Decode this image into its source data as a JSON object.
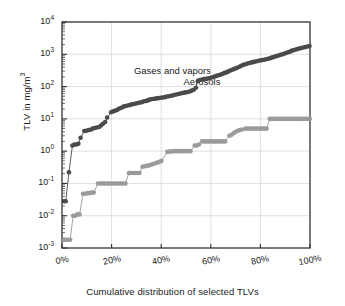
{
  "chart_data": {
    "type": "line",
    "title": "",
    "xlabel": "Cumulative distribution of selected TLVs",
    "ylabel": "TLV in mg/m3",
    "ylabel_display": "TLV in mg/m",
    "ylabel_exponent": "3",
    "xlim": [
      0,
      100
    ],
    "ylim": [
      0.001,
      10000
    ],
    "yscale": "log",
    "grid": true,
    "legend_position": "inline-annotation",
    "xticks": [
      0,
      20,
      40,
      60,
      80,
      100
    ],
    "xticklabels": [
      "0%",
      "20%",
      "40%",
      "60%",
      "80%",
      "100%"
    ],
    "yticks": [
      0.001,
      0.01,
      0.1,
      1,
      10,
      100,
      1000,
      10000
    ],
    "yticklabels": [
      "10-3",
      "10-2",
      "10-1",
      "100",
      "101",
      "102",
      "103",
      "104"
    ],
    "ytick_mantissa": "10",
    "ytick_exponents": [
      "-3",
      "-2",
      "-1",
      "0",
      "1",
      "2",
      "3",
      "4"
    ],
    "series": [
      {
        "name": "Gases and vapors",
        "color": "#4a4a4a",
        "label_x": 29,
        "label_y": 300,
        "points": [
          [
            0.8,
            0.028
          ],
          [
            1.5,
            0.028
          ],
          [
            2.8,
            0.22
          ],
          [
            4.2,
            1.5
          ],
          [
            5.0,
            1.6
          ],
          [
            5.8,
            1.6
          ],
          [
            6.6,
            1.7
          ],
          [
            7.5,
            2.6
          ],
          [
            9.0,
            4.2
          ],
          [
            9.9,
            4.3
          ],
          [
            10.7,
            4.5
          ],
          [
            11.5,
            4.6
          ],
          [
            12.4,
            5.0
          ],
          [
            13.2,
            5.2
          ],
          [
            14.0,
            5.4
          ],
          [
            14.9,
            5.6
          ],
          [
            15.7,
            6.2
          ],
          [
            16.5,
            7.0
          ],
          [
            17.4,
            8.0
          ],
          [
            18.2,
            11
          ],
          [
            19.8,
            16
          ],
          [
            20.6,
            17
          ],
          [
            21.5,
            18
          ],
          [
            22.3,
            19
          ],
          [
            23.1,
            21
          ],
          [
            24.0,
            22
          ],
          [
            24.8,
            24
          ],
          [
            25.6,
            25
          ],
          [
            26.5,
            26
          ],
          [
            27.3,
            27
          ],
          [
            28.1,
            28
          ],
          [
            29.0,
            29
          ],
          [
            29.8,
            30
          ],
          [
            30.6,
            31
          ],
          [
            31.5,
            32
          ],
          [
            32.3,
            33
          ],
          [
            33.1,
            35
          ],
          [
            34.0,
            36
          ],
          [
            34.8,
            38
          ],
          [
            35.6,
            40
          ],
          [
            36.5,
            41
          ],
          [
            37.3,
            42
          ],
          [
            38.1,
            43
          ],
          [
            39.0,
            44
          ],
          [
            39.8,
            45
          ],
          [
            40.6,
            46
          ],
          [
            41.5,
            47
          ],
          [
            42.3,
            49
          ],
          [
            43.1,
            50
          ],
          [
            44.0,
            52
          ],
          [
            44.8,
            54
          ],
          [
            45.6,
            56
          ],
          [
            46.5,
            58
          ],
          [
            47.3,
            60
          ],
          [
            48.1,
            62
          ],
          [
            49.0,
            64
          ],
          [
            49.8,
            66
          ],
          [
            50.6,
            68
          ],
          [
            51.5,
            70
          ],
          [
            52.3,
            75
          ],
          [
            53.1,
            80
          ],
          [
            54.0,
            92
          ],
          [
            54.8,
            150
          ],
          [
            55.6,
            160
          ],
          [
            56.5,
            165
          ],
          [
            57.3,
            170
          ],
          [
            58.1,
            175
          ],
          [
            59.0,
            180
          ],
          [
            59.8,
            185
          ],
          [
            60.6,
            195
          ],
          [
            61.5,
            205
          ],
          [
            62.3,
            215
          ],
          [
            63.1,
            225
          ],
          [
            64.0,
            235
          ],
          [
            64.8,
            250
          ],
          [
            65.6,
            265
          ],
          [
            66.5,
            280
          ],
          [
            67.3,
            300
          ],
          [
            68.1,
            320
          ],
          [
            69.0,
            340
          ],
          [
            69.8,
            360
          ],
          [
            70.6,
            380
          ],
          [
            71.5,
            410
          ],
          [
            72.3,
            440
          ],
          [
            73.1,
            470
          ],
          [
            74.0,
            490
          ],
          [
            74.8,
            520
          ],
          [
            75.6,
            540
          ],
          [
            76.5,
            560
          ],
          [
            77.3,
            580
          ],
          [
            78.1,
            600
          ],
          [
            79.0,
            620
          ],
          [
            79.8,
            640
          ],
          [
            80.6,
            660
          ],
          [
            81.5,
            680
          ],
          [
            82.3,
            700
          ],
          [
            83.1,
            730
          ],
          [
            84.0,
            760
          ],
          [
            84.8,
            800
          ],
          [
            85.6,
            840
          ],
          [
            86.5,
            880
          ],
          [
            87.3,
            920
          ],
          [
            88.1,
            960
          ],
          [
            89.0,
            1000
          ],
          [
            89.8,
            1060
          ],
          [
            90.6,
            1120
          ],
          [
            91.5,
            1180
          ],
          [
            92.3,
            1250
          ],
          [
            93.1,
            1320
          ],
          [
            94.0,
            1380
          ],
          [
            94.8,
            1450
          ],
          [
            95.6,
            1500
          ],
          [
            96.5,
            1560
          ],
          [
            97.3,
            1620
          ],
          [
            98.1,
            1680
          ],
          [
            99.0,
            1740
          ],
          [
            99.8,
            1800
          ]
        ]
      },
      {
        "name": "Aerosols",
        "color": "#9a9a9a",
        "label_x": 49,
        "label_y": 140,
        "points": [
          [
            0.8,
            0.0018
          ],
          [
            1.6,
            0.0018
          ],
          [
            2.5,
            0.0018
          ],
          [
            3.3,
            0.0018
          ],
          [
            4.5,
            0.01
          ],
          [
            5.4,
            0.01
          ],
          [
            6.2,
            0.011
          ],
          [
            7.1,
            0.011
          ],
          [
            8.5,
            0.048
          ],
          [
            9.4,
            0.048
          ],
          [
            10.2,
            0.05
          ],
          [
            11.1,
            0.05
          ],
          [
            11.9,
            0.052
          ],
          [
            12.8,
            0.052
          ],
          [
            14.5,
            0.1
          ],
          [
            15.4,
            0.1
          ],
          [
            16.2,
            0.1
          ],
          [
            17.1,
            0.1
          ],
          [
            17.9,
            0.1
          ],
          [
            18.8,
            0.1
          ],
          [
            19.6,
            0.1
          ],
          [
            20.5,
            0.1
          ],
          [
            21.3,
            0.1
          ],
          [
            22.2,
            0.1
          ],
          [
            23.0,
            0.1
          ],
          [
            23.9,
            0.1
          ],
          [
            24.7,
            0.1
          ],
          [
            25.6,
            0.1
          ],
          [
            27.0,
            0.21
          ],
          [
            27.8,
            0.21
          ],
          [
            28.7,
            0.21
          ],
          [
            29.5,
            0.21
          ],
          [
            30.4,
            0.21
          ],
          [
            31.2,
            0.21
          ],
          [
            32.5,
            0.33
          ],
          [
            33.3,
            0.34
          ],
          [
            34.2,
            0.35
          ],
          [
            35.0,
            0.36
          ],
          [
            35.9,
            0.38
          ],
          [
            36.7,
            0.4
          ],
          [
            37.6,
            0.42
          ],
          [
            38.4,
            0.44
          ],
          [
            39.3,
            0.47
          ],
          [
            40.1,
            0.5
          ],
          [
            42.5,
            0.95
          ],
          [
            43.3,
            0.97
          ],
          [
            44.2,
            0.98
          ],
          [
            45.0,
            0.99
          ],
          [
            45.9,
            1.0
          ],
          [
            46.7,
            1.0
          ],
          [
            47.6,
            1.0
          ],
          [
            48.4,
            1.0
          ],
          [
            49.3,
            1.0
          ],
          [
            50.1,
            1.0
          ],
          [
            51.0,
            1.0
          ],
          [
            51.8,
            1.0
          ],
          [
            53.5,
            1.5
          ],
          [
            54.3,
            1.5
          ],
          [
            55.2,
            1.6
          ],
          [
            56.5,
            2.0
          ],
          [
            57.3,
            2.0
          ],
          [
            58.2,
            2.0
          ],
          [
            59.0,
            2.0
          ],
          [
            59.9,
            2.0
          ],
          [
            60.7,
            2.0
          ],
          [
            61.6,
            2.0
          ],
          [
            62.4,
            2.0
          ],
          [
            63.3,
            2.0
          ],
          [
            64.1,
            2.0
          ],
          [
            65.0,
            2.0
          ],
          [
            65.8,
            2.0
          ],
          [
            67.5,
            3.0
          ],
          [
            68.3,
            3.2
          ],
          [
            69.2,
            3.6
          ],
          [
            70.0,
            4.0
          ],
          [
            70.9,
            4.3
          ],
          [
            71.7,
            4.5
          ],
          [
            72.6,
            4.7
          ],
          [
            74.0,
            5.0
          ],
          [
            74.8,
            5.0
          ],
          [
            75.7,
            5.0
          ],
          [
            76.5,
            5.0
          ],
          [
            77.4,
            5.0
          ],
          [
            78.2,
            5.0
          ],
          [
            79.1,
            5.0
          ],
          [
            79.9,
            5.0
          ],
          [
            80.8,
            5.0
          ],
          [
            81.6,
            5.0
          ],
          [
            82.5,
            5.0
          ],
          [
            83.8,
            10
          ],
          [
            84.6,
            10
          ],
          [
            85.5,
            10
          ],
          [
            86.3,
            10
          ],
          [
            87.2,
            10
          ],
          [
            88.0,
            10
          ],
          [
            88.9,
            10
          ],
          [
            89.7,
            10
          ],
          [
            90.6,
            10
          ],
          [
            91.4,
            10
          ],
          [
            92.3,
            10
          ],
          [
            93.1,
            10
          ],
          [
            94.0,
            10
          ],
          [
            94.8,
            10
          ],
          [
            95.7,
            10
          ],
          [
            96.5,
            10
          ],
          [
            97.4,
            10
          ],
          [
            98.2,
            10
          ],
          [
            99.1,
            10
          ],
          [
            99.9,
            10
          ]
        ]
      }
    ]
  },
  "colors": {
    "axis": "#333333",
    "grid": "#d8d8d8",
    "text": "#1a1a1a",
    "gases": "#4a4a4a",
    "aerosols": "#9a9a9a"
  }
}
